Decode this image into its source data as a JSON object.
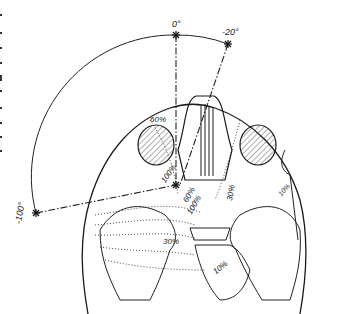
{
  "figure": {
    "type": "anatomical line drawing",
    "ink_color": "#1a1a1a",
    "background": "#ffffff"
  },
  "angles": [
    {
      "id": "a0",
      "label": "0°"
    },
    {
      "id": "a20",
      "label": "-20°"
    },
    {
      "id": "a100",
      "label": "-100°"
    }
  ],
  "isodose_labels": [
    {
      "id": "d60a",
      "label": "60%"
    },
    {
      "id": "d100a",
      "label": "100%"
    },
    {
      "id": "d60b",
      "label": "60%"
    },
    {
      "id": "d30a",
      "label": "30%"
    },
    {
      "id": "d10a",
      "label": "10%"
    },
    {
      "id": "d100b",
      "label": "100%"
    },
    {
      "id": "d30b",
      "label": "30%"
    },
    {
      "id": "d10b",
      "label": "10%"
    }
  ]
}
